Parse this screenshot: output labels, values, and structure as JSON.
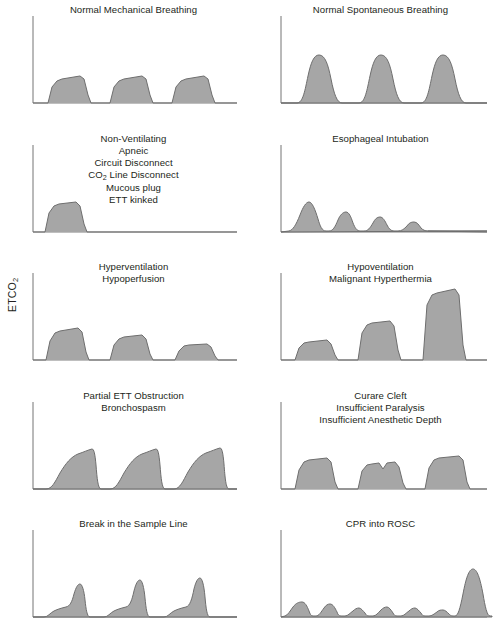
{
  "figure": {
    "name": "capnography-waveform-reference-chart",
    "y_axis_label": "ETCO",
    "y_axis_label_sub": "2",
    "columns": 2,
    "rows": 5,
    "colors": {
      "waveform_fill": "#a6a6a6",
      "waveform_stroke": "#6d6d6d",
      "axis": "#808080",
      "text": "#231f20",
      "background": "#ffffff"
    }
  },
  "chart_data": {
    "type": "line",
    "title": "",
    "xlabel": "Time",
    "ylabel": "ETCO2",
    "grid": false,
    "legend": "none",
    "panels": [
      {
        "id": "normal-mechanical-breathing",
        "title": "Normal Mechanical Breathing",
        "title_lines": [
          "Normal Mechanical Breathing"
        ],
        "row": 0,
        "col": 0,
        "description": "Three uniform square/trapezoidal plateau waveforms of equal normal amplitude with flat alveolar plateaus and sharp downstrokes.",
        "waveform_type": "normal-square-plateau",
        "peak_amplitudes": [
          0.3,
          0.3,
          0.3
        ],
        "breath_count": 3
      },
      {
        "id": "normal-spontaneous-breathing",
        "title": "Normal Spontaneous Breathing",
        "title_lines": [
          "Normal Spontaneous Breathing"
        ],
        "row": 0,
        "col": 1,
        "description": "Three tall rounded dome-shaped waveforms of equal amplitude typical of spontaneous ventilation.",
        "waveform_type": "rounded-dome",
        "peak_amplitudes": [
          0.72,
          0.72,
          0.72
        ],
        "breath_count": 3
      },
      {
        "id": "non-ventilating",
        "title": "Non-Ventilating / Apneic / Circuit Disconnect / CO2 Line Disconnect / Mucous plug / ETT kinked",
        "title_lines": [
          "Non-Ventilating",
          "Apneic",
          "Circuit Disconnect",
          "CO|2| Line Disconnect",
          "Mucous plug",
          "ETT kinked"
        ],
        "row": 1,
        "col": 0,
        "description": "A single normal plateau waveform followed by a completely flat zero baseline — no further breaths.",
        "waveform_type": "single-then-flatline",
        "peak_amplitudes": [
          0.36
        ],
        "breath_count": 1
      },
      {
        "id": "esophageal-intubation",
        "title": "Esophageal Intubation",
        "title_lines": [
          "Esophageal Intubation"
        ],
        "row": 1,
        "col": 1,
        "description": "Progressively diminishing small rounded peaks washing out to a near-flat tail.",
        "waveform_type": "diminishing-peaks",
        "peak_amplitudes": [
          0.26,
          0.16,
          0.11,
          0.08,
          0.03
        ],
        "breath_count": 5
      },
      {
        "id": "hyperventilation-hypoperfusion",
        "title": "Hyperventilation / Hypoperfusion",
        "title_lines": [
          "Hyperventilation",
          "Hypoperfusion"
        ],
        "row": 2,
        "col": 0,
        "description": "Successive plateau waveforms of progressively decreasing amplitude.",
        "waveform_type": "decreasing-plateau",
        "peak_amplitudes": [
          0.33,
          0.26,
          0.18
        ],
        "breath_count": 3
      },
      {
        "id": "hypoventilation-malignant-hyperthermia",
        "title": "Hypoventilation / Malignant Hyperthermia",
        "title_lines": [
          "Hypoventilation",
          "Malignant Hyperthermia"
        ],
        "row": 2,
        "col": 1,
        "description": "Successive plateau waveforms of progressively increasing amplitude.",
        "waveform_type": "increasing-plateau",
        "peak_amplitudes": [
          0.26,
          0.45,
          0.68
        ],
        "breath_count": 3
      },
      {
        "id": "partial-ett-obstruction",
        "title": "Partial ETT Obstruction / Bronchospasm",
        "title_lines": [
          "Partial ETT Obstruction",
          "Bronchospasm"
        ],
        "row": 3,
        "col": 0,
        "description": "Shark-fin shaped waveforms with prolonged sloping upstroke and no true plateau.",
        "waveform_type": "shark-fin",
        "peak_amplitudes": [
          0.46,
          0.46,
          0.48
        ],
        "breath_count": 3
      },
      {
        "id": "curare-cleft",
        "title": "Curare Cleft / Insufficient Paralysis / Insufficient Anesthetic Depth",
        "title_lines": [
          "Curare Cleft",
          "Insufficient Paralysis",
          "Insufficient Anesthetic Depth"
        ],
        "row": 3,
        "col": 1,
        "description": "Plateau waveforms where the middle breath shows a notch (cleft) dipping into the alveolar plateau.",
        "waveform_type": "plateau-with-cleft",
        "peak_amplitudes": [
          0.34,
          0.3,
          0.36
        ],
        "cleft_on_breath": 2,
        "breath_count": 3
      },
      {
        "id": "break-in-sample-line",
        "title": "Break in the Sample Line",
        "title_lines": [
          "Break in the Sample Line"
        ],
        "row": 4,
        "col": 0,
        "description": "Waveforms with a low sloping shoulder that rises into a late narrow spike before abrupt descent.",
        "waveform_type": "sloping-with-terminal-spike",
        "peak_amplitudes": [
          0.34,
          0.38,
          0.4
        ],
        "breath_count": 3
      },
      {
        "id": "cpr-into-rosc",
        "title": "CPR into ROSC",
        "title_lines": [
          "CPR into ROSC"
        ],
        "row": 4,
        "col": 1,
        "description": "Series of small low-amplitude compression bumps followed by a single tall sustained peak marking return of spontaneous circulation.",
        "waveform_type": "low-bumps-then-tall-peak",
        "peak_amplitudes": [
          0.14,
          0.14,
          0.08,
          0.09,
          0.08,
          0.06,
          0.82
        ],
        "breath_count": 7
      }
    ]
  }
}
